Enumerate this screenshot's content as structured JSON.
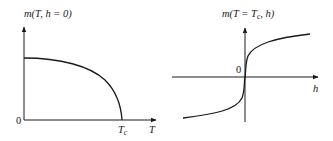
{
  "figures": [
    {
      "id": "left",
      "title": "m(T, h = 0)",
      "x_axis_label": "T",
      "origin_label": "0",
      "tick_label": "Tc",
      "tick_label_main": "T",
      "tick_label_sub": "c",
      "description": "Spontaneous magnetization vs temperature at zero field, vanishing at Tc"
    },
    {
      "id": "right",
      "title": "m(T = Tc, h)",
      "title_parts": {
        "prefix": "m(T = T",
        "sub": "c",
        "suffix": ", h)"
      },
      "x_axis_label": "h",
      "origin_label": "0",
      "description": "Critical isotherm: magnetization vs field at T = Tc"
    }
  ],
  "colors": {
    "stroke": "#1a1a1a",
    "background": "#ffffff"
  }
}
